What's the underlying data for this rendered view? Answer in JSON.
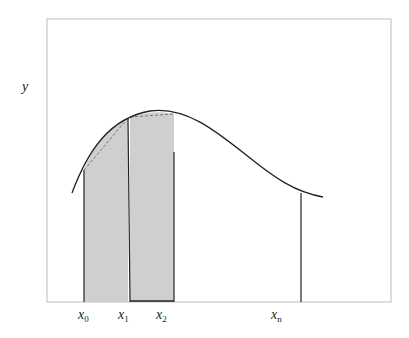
{
  "diagram": {
    "y_axis_label": "y",
    "x_labels": [
      {
        "base": "x",
        "sub": "0"
      },
      {
        "base": "x",
        "sub": "1"
      },
      {
        "base": "x",
        "sub": "2"
      },
      {
        "base": "x",
        "sub": "n"
      }
    ],
    "colors": {
      "frame": "#c8c8c8",
      "curve": "#222222",
      "fill": "#cfcfcf",
      "dashed_chord": "#777777",
      "vertical_lines": "#222222"
    },
    "shaded_strips": [
      {
        "from": "x0",
        "to": "x1"
      },
      {
        "from": "x1",
        "to": "x2"
      }
    ]
  }
}
